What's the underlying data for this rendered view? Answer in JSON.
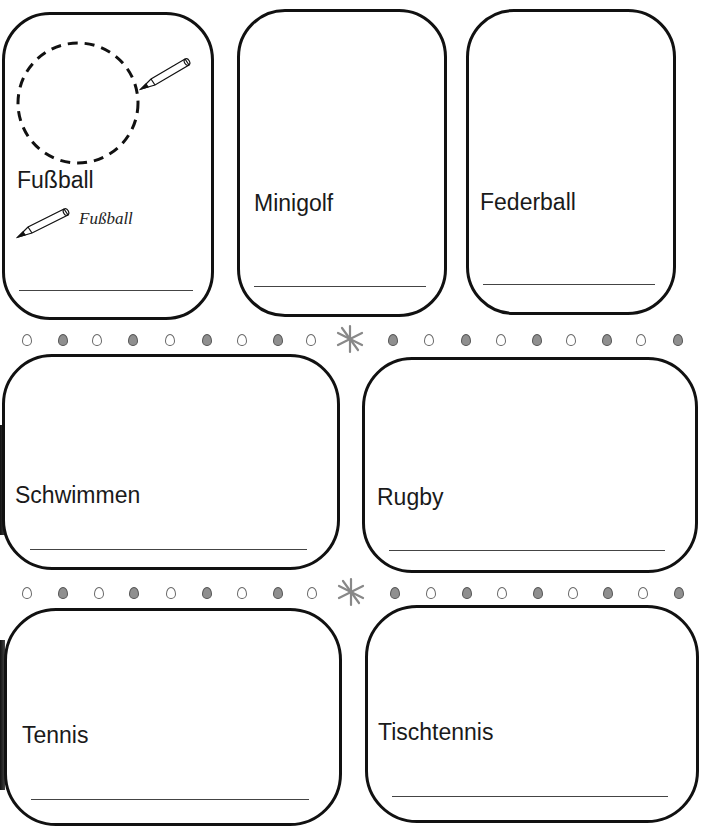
{
  "worksheet": {
    "cards": [
      {
        "id": "fussball",
        "label": "Fußball",
        "example_word": "Fußball"
      },
      {
        "id": "minigolf",
        "label": "Minigolf"
      },
      {
        "id": "federball",
        "label": "Federball"
      },
      {
        "id": "schwimmen",
        "label": "Schwimmen"
      },
      {
        "id": "rugby",
        "label": "Rugby"
      },
      {
        "id": "tennis",
        "label": "Tennis"
      },
      {
        "id": "tischtennis",
        "label": "Tischtennis"
      }
    ],
    "icons": {
      "pencil": "pencil-icon",
      "dashed_circle": "drawing-area-circle",
      "star": "asterisk-star-icon",
      "dot": "decorative-dot"
    },
    "colors": {
      "border": "#111111",
      "dot_filled": "#8f8f8f",
      "dot_empty": "#ffffff",
      "line": "#444444"
    }
  }
}
